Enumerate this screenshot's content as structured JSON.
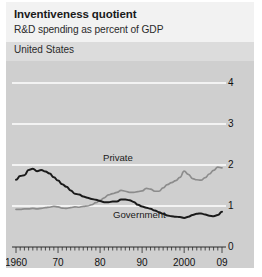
{
  "header": {
    "title": "Inventiveness quotient",
    "subtitle": "R&D spending as percent of GDP",
    "region": "United States"
  },
  "colors": {
    "card_background": "#e9e9e9",
    "header_background": "#f2f2f2",
    "region_band": "#dcdcdc",
    "plot_background": "#cfcfcf",
    "gridline": "#ffffff",
    "government_line": "#1a1a1a",
    "private_line": "#8c8c8c",
    "text": "#1a1a1a"
  },
  "chart_data": {
    "type": "line",
    "title": "Inventiveness quotient",
    "subtitle": "R&D spending as percent of GDP",
    "region": "United States",
    "xlabel": "",
    "ylabel": "",
    "xlim": [
      1960,
      2009
    ],
    "ylim": [
      0,
      4
    ],
    "yticks": [
      0,
      1,
      2,
      3,
      4
    ],
    "ytick_labels": [
      "0",
      "1",
      "2",
      "3",
      "4"
    ],
    "xticks": [
      1960,
      1970,
      1980,
      1990,
      2000,
      2009
    ],
    "xtick_labels": [
      "1960",
      "70",
      "80",
      "90",
      "2000",
      "09"
    ],
    "minor_xtick_interval": 1,
    "grid": "horizontal",
    "legend": "inline-labels",
    "x": [
      1960,
      1961,
      1962,
      1963,
      1964,
      1965,
      1966,
      1967,
      1968,
      1969,
      1970,
      1971,
      1972,
      1973,
      1974,
      1975,
      1976,
      1977,
      1978,
      1979,
      1980,
      1981,
      1982,
      1983,
      1984,
      1985,
      1986,
      1987,
      1988,
      1989,
      1990,
      1991,
      1992,
      1993,
      1994,
      1995,
      1996,
      1997,
      1998,
      1999,
      2000,
      2001,
      2002,
      2003,
      2004,
      2005,
      2006,
      2007,
      2008,
      2009
    ],
    "series": [
      {
        "name": "Government",
        "label": "Government",
        "color": "#1a1a1a",
        "values": [
          1.64,
          1.73,
          1.75,
          1.88,
          1.91,
          1.85,
          1.88,
          1.84,
          1.79,
          1.7,
          1.62,
          1.53,
          1.47,
          1.38,
          1.3,
          1.28,
          1.23,
          1.2,
          1.17,
          1.15,
          1.12,
          1.09,
          1.09,
          1.11,
          1.11,
          1.16,
          1.16,
          1.14,
          1.1,
          1.03,
          0.99,
          0.96,
          0.93,
          0.89,
          0.85,
          0.81,
          0.77,
          0.75,
          0.74,
          0.73,
          0.71,
          0.74,
          0.78,
          0.81,
          0.82,
          0.79,
          0.76,
          0.75,
          0.78,
          0.86
        ]
      },
      {
        "name": "Private",
        "label": "Private",
        "color": "#8c8c8c",
        "values": [
          0.92,
          0.92,
          0.93,
          0.93,
          0.94,
          0.93,
          0.94,
          0.96,
          0.97,
          0.99,
          0.98,
          0.95,
          0.94,
          0.96,
          0.98,
          0.97,
          0.99,
          1.0,
          1.03,
          1.08,
          1.14,
          1.2,
          1.27,
          1.3,
          1.33,
          1.38,
          1.36,
          1.33,
          1.33,
          1.35,
          1.37,
          1.43,
          1.41,
          1.36,
          1.36,
          1.44,
          1.52,
          1.57,
          1.62,
          1.7,
          1.85,
          1.77,
          1.67,
          1.64,
          1.63,
          1.69,
          1.78,
          1.87,
          1.95,
          1.93
        ]
      }
    ]
  }
}
